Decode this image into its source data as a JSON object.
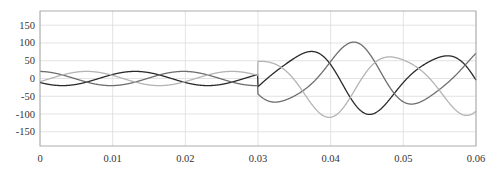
{
  "chart_data": {
    "type": "line",
    "title": "",
    "xlabel": "",
    "ylabel": "",
    "xlim": [
      0,
      0.06
    ],
    "ylim": [
      -190,
      190
    ],
    "grid": true,
    "legend": null,
    "x_ticks": [
      "0",
      "0.01",
      "0.02",
      "0.03",
      "0.04",
      "0.05",
      "0.06"
    ],
    "y_ticks": [
      "150",
      "100",
      "50",
      "0",
      "-50",
      "-100",
      "-150"
    ],
    "x_tick_values": [
      0,
      0.01,
      0.02,
      0.03,
      0.04,
      0.05,
      0.06
    ],
    "y_tick_values": [
      150,
      100,
      50,
      0,
      -50,
      -100,
      -150
    ],
    "frequency_hz": 50,
    "disturbance_time": 0.03,
    "series": [
      {
        "name": "phase-a",
        "color": "#2a2a2a",
        "phase_deg": 0,
        "amp_before": 20,
        "amp_after": [
          110,
          55
        ],
        "note": "dark curve"
      },
      {
        "name": "phase-b",
        "color": "#6e6e6e",
        "phase_deg": -120,
        "amp_before": 20,
        "amp_after": [
          110,
          55
        ],
        "note": "medium gray curve"
      },
      {
        "name": "phase-c",
        "color": "#b4b4b4",
        "phase_deg": 120,
        "amp_before": 20,
        "amp_after": [
          110,
          55
        ],
        "note": "light gray curve"
      }
    ]
  }
}
